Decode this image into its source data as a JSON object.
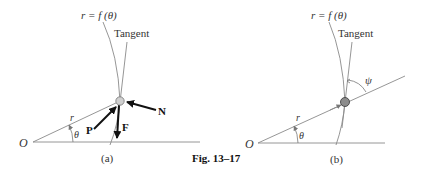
{
  "figure": {
    "caption": "Fig. 13–17",
    "colors": {
      "line": "#8a8a8a",
      "arrow": "#111111",
      "text": "#333333",
      "particle": "#bdbdbd",
      "particle_b": "#707070"
    }
  },
  "panel_a": {
    "label": "(a)",
    "curve_label": "r = f (θ)",
    "tangent_label": "Tangent",
    "origin_label": "O",
    "radius_label": "r",
    "angle_label": "θ",
    "forces": {
      "N": "N",
      "P": "P",
      "F": "F"
    }
  },
  "panel_b": {
    "label": "(b)",
    "curve_label": "r = f (θ)",
    "tangent_label": "Tangent",
    "origin_label": "O",
    "radius_label": "r",
    "angle_label": "θ",
    "psi_label": "ψ"
  }
}
